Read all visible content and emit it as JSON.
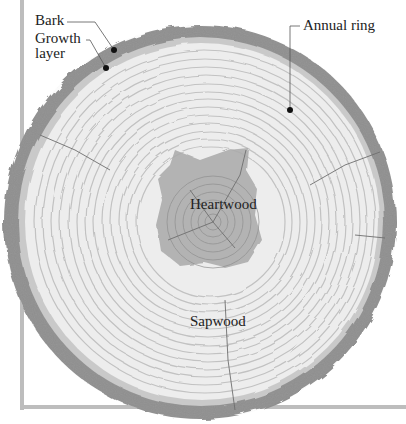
{
  "diagram": {
    "labels": {
      "bark": "Bark",
      "growth_layer_line1": "Growth",
      "growth_layer_line2": "layer",
      "annual_ring": "Annual ring",
      "heartwood": "Heartwood",
      "sapwood": "Sapwood"
    },
    "colors": {
      "bark": "#8f8f8f",
      "bark_dark": "#7a7a7a",
      "cambium": "#c9c9c9",
      "sapwood": "#ececec",
      "ring_line": "#c4c4c4",
      "heartwood": "#a8a8a8",
      "frame": "#bdbdbd",
      "leader": "#555555",
      "text": "#222222"
    }
  }
}
